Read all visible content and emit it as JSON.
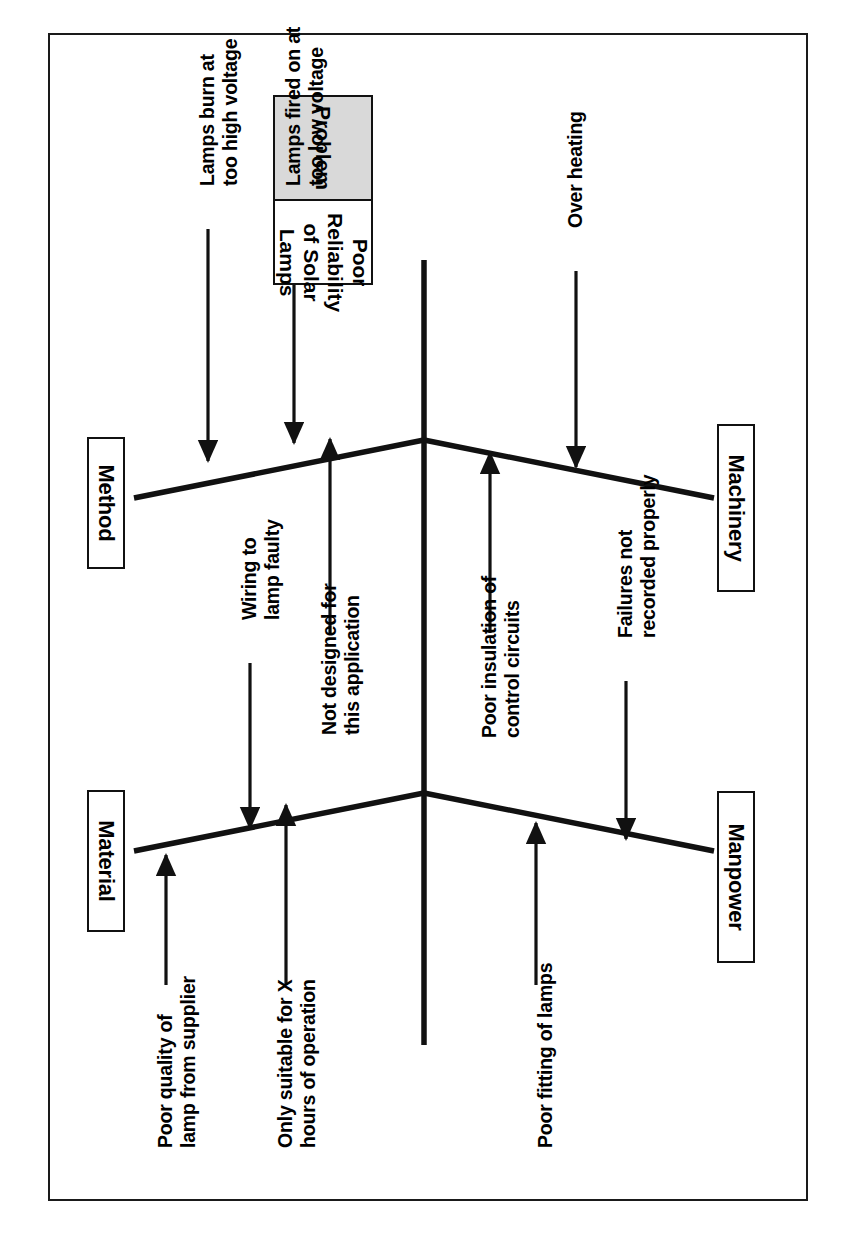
{
  "diagram": {
    "type": "fishbone-ishikawa",
    "problem": {
      "header_label": "Problem",
      "statement_line1": "Poor Reliability",
      "statement_line2": "of Solar Lamps"
    },
    "categories": [
      {
        "id": "method",
        "label": "Method"
      },
      {
        "id": "machinery",
        "label": "Machinery"
      },
      {
        "id": "material",
        "label": "Material"
      },
      {
        "id": "manpower",
        "label": "Manpower"
      }
    ],
    "causes": [
      {
        "id": "lamps-burn-high-voltage",
        "category": "method",
        "line1": "Lamps burn at",
        "line2": "too high voltage"
      },
      {
        "id": "lamps-fired-low-voltage",
        "category": "method",
        "line1": "Lamps fired on at",
        "line2": "too low voltage"
      },
      {
        "id": "not-designed-for-application",
        "category": "method",
        "line1": "Not designed for",
        "line2": "this application"
      },
      {
        "id": "over-heating",
        "category": "machinery",
        "line1": "Over heating",
        "line2": ""
      },
      {
        "id": "poor-insulation-control-circuits",
        "category": "machinery",
        "line1": "Poor insulation of",
        "line2": "control circuits"
      },
      {
        "id": "wiring-to-lamp-faulty",
        "category": "material",
        "line1": "Wiring to",
        "line2": "lamp faulty"
      },
      {
        "id": "poor-quality-lamp-supplier",
        "category": "material",
        "line1": "Poor quality of",
        "line2": "lamp from supplier"
      },
      {
        "id": "only-suitable-x-hours",
        "category": "material",
        "line1": "Only suitable for X",
        "line2": "hours of operation"
      },
      {
        "id": "poor-fitting-of-lamps",
        "category": "manpower",
        "line1": "Poor fitting of lamps",
        "line2": ""
      },
      {
        "id": "failures-not-recorded",
        "category": "manpower",
        "line1": "Failures not",
        "line2": "recorded properly"
      }
    ],
    "colors": {
      "line": "#111111",
      "problem_header_fill": "#d9d9d9",
      "frame": "#1a1a1a",
      "background": "#ffffff"
    }
  }
}
